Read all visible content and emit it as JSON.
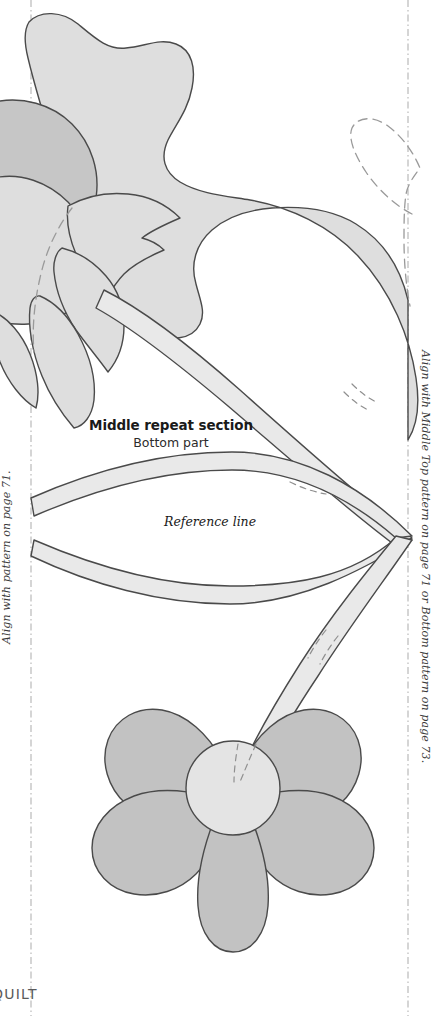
{
  "page": {
    "width": 446,
    "height": 1016,
    "background": "#ffffff",
    "kind": "appliqué quilt pattern template sheet"
  },
  "heading": {
    "title": "Middle repeat section",
    "subtitle": "Bottom part"
  },
  "reference": {
    "label": "Reference line",
    "y": 538
  },
  "edge_labels": {
    "left": "Align with pattern on page 71.",
    "right": "Align with Middle Top pattern on page 71 or Bottom pattern on page 73."
  },
  "footer": {
    "crop_text": "QUILT"
  },
  "guides": {
    "left_x": 31,
    "right_x": 408,
    "style": "dash-dot",
    "color": "#b9b9b9"
  },
  "colors": {
    "leaf_fill": "#dedede",
    "petal_fill": "#c2c2c2",
    "petal_back_fill": "#c6c6c6",
    "vine_fill": "#e9e9e9",
    "flower_center_fill": "#e4e4e4",
    "outline": "#4a4a4a",
    "dashed_outline": "#9a9a9a",
    "reference_line": "#1a1a1a",
    "guide_line": "#b9b9b9",
    "text_primary": "#1a1a1a",
    "text_secondary": "#3a3a3a",
    "footer_text": "#5a5a5a"
  },
  "shapes": {
    "top_leaf": "large lobed leaf sweeping from top-left to right edge",
    "top_flower": "spiky multi-petal flower at left edge, partially cropped",
    "top_flower_back_petal": "darker rounded petal behind the spiky flower",
    "dashed_leaf_tip": "dashed outline of adjoining leaf at right edge",
    "main_stem": "diagonal vine band from upper-left flower to lower-right",
    "upper_vine": "arcing vine band above the reference line",
    "lower_vine": "arcing vine band below the reference line",
    "bottom_stem": "vine band curving down to the bottom flower",
    "bottom_flower": "five heart-shaped petals with round center",
    "accent_marks": "small dashed tick marks on the vines"
  }
}
